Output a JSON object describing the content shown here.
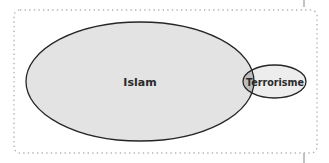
{
  "diagram": {
    "type": "euler",
    "sets": [
      {
        "label": "Islam",
        "fill": "#e3e3e3",
        "stroke": "#262626"
      },
      {
        "label": "Terrorisme",
        "fill": "#ededed",
        "stroke": "#262626"
      }
    ],
    "overlap_fill": "#bdbdbd",
    "frame": {
      "style": "dotted",
      "color": "#b5b5b5"
    }
  }
}
